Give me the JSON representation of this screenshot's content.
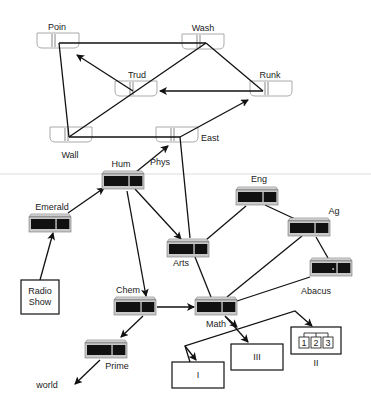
{
  "diagram": {
    "top_nodes": [
      {
        "id": "poin",
        "label": "Poin",
        "x": 37,
        "y": 33,
        "lx": 57,
        "ly": 30
      },
      {
        "id": "wash",
        "label": "Wash",
        "x": 182,
        "y": 34,
        "lx": 203,
        "ly": 31
      },
      {
        "id": "trud",
        "label": "Trud",
        "x": 115,
        "y": 81,
        "lx": 137,
        "ly": 78
      },
      {
        "id": "runk",
        "label": "Runk",
        "x": 250,
        "y": 81,
        "lx": 270,
        "ly": 78
      },
      {
        "id": "wall",
        "label": "Wall",
        "x": 50,
        "y": 127,
        "lx": 70,
        "ly": 158
      },
      {
        "id": "east",
        "label": "East",
        "x": 156,
        "y": 127,
        "lx": 210,
        "ly": 141
      }
    ],
    "servers": [
      {
        "id": "hum",
        "label": "Hum",
        "x": 102,
        "y": 171,
        "lx": 121,
        "ly": 167
      },
      {
        "id": "emerald",
        "label": "Emerald",
        "x": 29,
        "y": 214,
        "lx": 52,
        "ly": 210
      },
      {
        "id": "eng",
        "label": "Eng",
        "x": 236,
        "y": 187,
        "lx": 259,
        "ly": 182
      },
      {
        "id": "ag",
        "label": "Ag",
        "x": 288,
        "y": 218,
        "lx": 334,
        "ly": 214
      },
      {
        "id": "arts",
        "label": "Arts",
        "x": 167,
        "y": 239,
        "lx": 181,
        "ly": 266
      },
      {
        "id": "abacus",
        "label": "Abacus",
        "x": 310,
        "y": 258,
        "lx": 316,
        "ly": 294
      },
      {
        "id": "chem",
        "label": "Chem",
        "x": 114,
        "y": 297,
        "lx": 128,
        "ly": 293
      },
      {
        "id": "math",
        "label": "Math",
        "x": 195,
        "y": 297,
        "lx": 216,
        "ly": 327
      },
      {
        "id": "prime",
        "label": "Prime",
        "x": 85,
        "y": 340,
        "lx": 117,
        "ly": 369
      }
    ],
    "extra_labels": [
      {
        "id": "phys",
        "label": "Phys",
        "x": 160,
        "y": 165
      },
      {
        "id": "world",
        "label": "world",
        "x": 47,
        "y": 388
      }
    ],
    "boxes": [
      {
        "id": "radio",
        "lines": [
          "Radio",
          "Show"
        ],
        "x": 21,
        "y": 280,
        "w": 38,
        "h": 34
      },
      {
        "id": "box1",
        "label": "I",
        "x": 172,
        "y": 362,
        "w": 52,
        "h": 26
      },
      {
        "id": "box3",
        "label": "III",
        "x": 231,
        "y": 344,
        "w": 52,
        "h": 26
      },
      {
        "id": "box2",
        "label": "II",
        "x": 291,
        "y": 327,
        "w": 50,
        "h": 27,
        "sub": [
          "1",
          "2",
          "3"
        ]
      }
    ]
  }
}
